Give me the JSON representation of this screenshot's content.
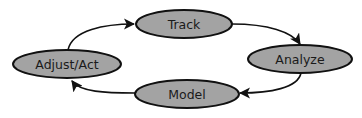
{
  "diagram": {
    "type": "cycle",
    "colors": {
      "node_fill": "#a3a3a3",
      "node_stroke": "#111111",
      "edge": "#111111",
      "background": "#ffffff"
    },
    "nodes": [
      {
        "id": "track",
        "label": "Track"
      },
      {
        "id": "analyze",
        "label": "Analyze"
      },
      {
        "id": "model",
        "label": "Model"
      },
      {
        "id": "adjust",
        "label": "Adjust/Act"
      }
    ],
    "edges": [
      {
        "from": "adjust",
        "to": "track"
      },
      {
        "from": "track",
        "to": "analyze"
      },
      {
        "from": "analyze",
        "to": "model"
      },
      {
        "from": "model",
        "to": "adjust"
      }
    ]
  }
}
